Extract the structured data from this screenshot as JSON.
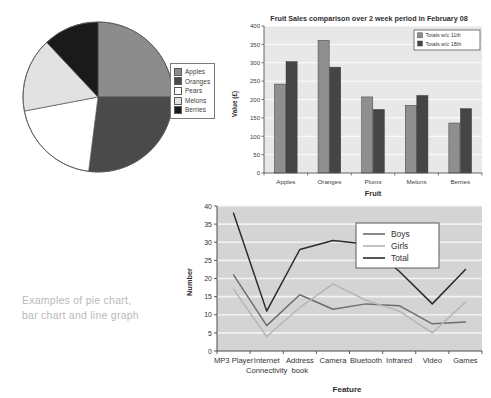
{
  "caption": {
    "line1": "Examples of pie chart,",
    "line2": "bar chart and line graph"
  },
  "pie": {
    "legend_title": "",
    "items": [
      {
        "label": "Apples",
        "value": 25,
        "color": "#8c8c8c"
      },
      {
        "label": "Oranges",
        "value": 27,
        "color": "#4a4a4a"
      },
      {
        "label": "Pears",
        "value": 20,
        "color": "#ffffff"
      },
      {
        "label": "Melons",
        "value": 16,
        "color": "#e2e2e2"
      },
      {
        "label": "Berries",
        "value": 12,
        "color": "#1a1a1a"
      }
    ]
  },
  "bar": {
    "title": "Fruit Sales comparison over 2 week period in February 08",
    "xlabel": "Fruit",
    "ylabel": "Value (£)",
    "legend": [
      {
        "label": "Totals w/c 11th",
        "color": "#8f8f8f"
      },
      {
        "label": "Totals w/c 18th",
        "color": "#454545"
      }
    ],
    "yticks": [
      "0",
      "50",
      "100",
      "150",
      "200",
      "250",
      "300",
      "350",
      "400"
    ]
  },
  "line": {
    "xlabel": "Feature",
    "ylabel": "Number",
    "legend": [
      {
        "label": "Boys",
        "color": "#6e6e6e"
      },
      {
        "label": "Girls",
        "color": "#b5b5b5"
      },
      {
        "label": "Total",
        "color": "#2b2b2b"
      }
    ],
    "yticks": [
      "0",
      "5",
      "10",
      "15",
      "20",
      "25",
      "30",
      "35",
      "40"
    ]
  },
  "chart_data": [
    {
      "type": "pie",
      "title": "",
      "labels": [
        "Apples",
        "Oranges",
        "Pears",
        "Melons",
        "Berries"
      ],
      "values": [
        25,
        27,
        20,
        16,
        12
      ],
      "colors": [
        "#8c8c8c",
        "#4a4a4a",
        "#ffffff",
        "#e2e2e2",
        "#1a1a1a"
      ],
      "legend_position": "right",
      "start_angle": 0,
      "direction": "clockwise"
    },
    {
      "type": "bar",
      "title": "Fruit Sales comparison over 2 week period in February 08",
      "categories": [
        "Apples",
        "Oranges",
        "Plums",
        "Melons",
        "Berries"
      ],
      "series": [
        {
          "name": "Totals w/c 11th",
          "color": "#8f8f8f",
          "values": [
            242,
            361,
            207,
            184,
            136
          ]
        },
        {
          "name": "Totals w/c 18th",
          "color": "#454545",
          "values": [
            303,
            288,
            173,
            211,
            175
          ]
        }
      ],
      "xlabel": "Fruit",
      "ylabel": "Value (£)",
      "ylim": [
        0,
        400
      ],
      "ytick_step": 50,
      "grid": true,
      "legend_position": "top-right"
    },
    {
      "type": "line",
      "title": "",
      "categories": [
        "MP3 Player",
        "Internet Connectivity",
        "Address book",
        "Camera",
        "Bluetooth",
        "Infrared",
        "Video",
        "Games"
      ],
      "series": [
        {
          "name": "Boys",
          "color": "#6e6e6e",
          "values": [
            21,
            7,
            15.5,
            11.5,
            13,
            12.5,
            7.5,
            8
          ]
        },
        {
          "name": "Girls",
          "color": "#b5b5b5",
          "values": [
            17,
            4,
            12,
            18.5,
            14,
            11,
            5,
            13.5
          ]
        },
        {
          "name": "Total",
          "color": "#2b2b2b",
          "values": [
            38,
            11,
            28,
            30.5,
            29.5,
            22,
            13,
            22.5
          ]
        }
      ],
      "xlabel": "Feature",
      "ylabel": "Number",
      "ylim": [
        0,
        40
      ],
      "ytick_step": 5,
      "grid": true,
      "legend_position": "top-right"
    }
  ]
}
